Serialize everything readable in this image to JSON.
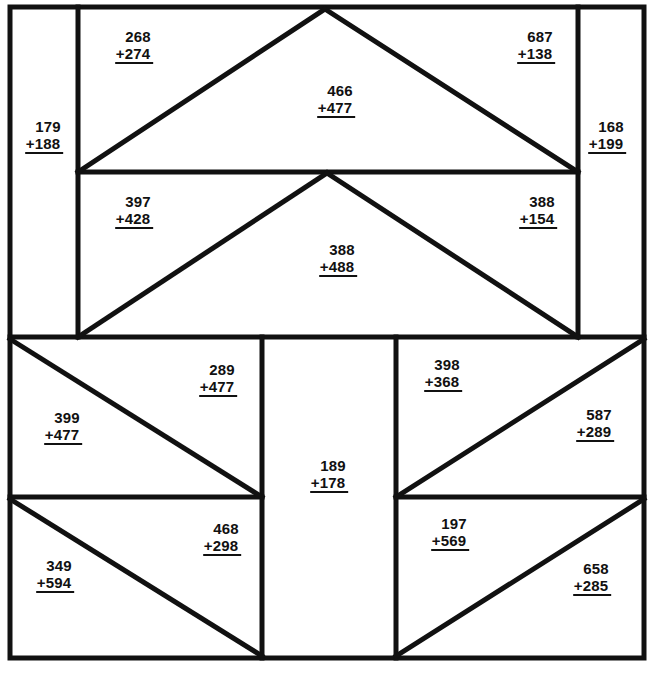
{
  "page": {
    "width": 652,
    "height": 673,
    "background_color": "#ffffff",
    "line_color": "#111111",
    "text_color": "#111111"
  },
  "figure": {
    "outer_border": {
      "x": 10,
      "y": 7,
      "width": 634,
      "height": 651
    },
    "regions": [
      {
        "name": "top-left-side-panel",
        "shape": "rectangle"
      },
      {
        "name": "top-band-upper-left-triangle",
        "shape": "triangle"
      },
      {
        "name": "top-band-upper-center-triangle",
        "shape": "triangle"
      },
      {
        "name": "top-band-upper-right-triangle",
        "shape": "triangle"
      },
      {
        "name": "top-right-side-panel",
        "shape": "rectangle"
      },
      {
        "name": "top-band-lower-left-triangle",
        "shape": "triangle"
      },
      {
        "name": "top-band-lower-center-triangle",
        "shape": "triangle"
      },
      {
        "name": "top-band-lower-right-triangle",
        "shape": "triangle"
      },
      {
        "name": "bottom-center-panel",
        "shape": "rectangle"
      },
      {
        "name": "bottom-upper-left-triangle-a",
        "shape": "triangle"
      },
      {
        "name": "bottom-upper-left-triangle-b",
        "shape": "triangle"
      },
      {
        "name": "bottom-upper-right-triangle-a",
        "shape": "triangle"
      },
      {
        "name": "bottom-upper-right-triangle-b",
        "shape": "triangle"
      },
      {
        "name": "bottom-lower-left-triangle-a",
        "shape": "triangle"
      },
      {
        "name": "bottom-lower-left-triangle-b",
        "shape": "triangle"
      },
      {
        "name": "bottom-lower-right-triangle-a",
        "shape": "triangle"
      },
      {
        "name": "bottom-lower-right-triangle-b",
        "shape": "triangle"
      }
    ]
  },
  "problems": [
    {
      "id": "p01",
      "region": "top-left-side-panel",
      "top": "179",
      "bottom": "+188",
      "x": 44,
      "y": 136
    },
    {
      "id": "p02",
      "region": "top-band-upper-left-triangle",
      "top": "268",
      "bottom": "+274",
      "x": 134,
      "y": 46
    },
    {
      "id": "p03",
      "region": "top-band-upper-center-triangle",
      "top": "466",
      "bottom": "+477",
      "x": 336,
      "y": 100
    },
    {
      "id": "p04",
      "region": "top-band-upper-right-triangle",
      "top": "687",
      "bottom": "+138",
      "x": 536,
      "y": 46
    },
    {
      "id": "p05",
      "region": "top-right-side-panel",
      "x": 607,
      "y": 136,
      "top": "168",
      "bottom": "+199"
    },
    {
      "id": "p06",
      "region": "top-band-lower-left-triangle",
      "top": "397",
      "bottom": "+428",
      "x": 134,
      "y": 211
    },
    {
      "id": "p07",
      "region": "top-band-lower-center-triangle",
      "top": "388",
      "bottom": "+488",
      "x": 338,
      "y": 259
    },
    {
      "id": "p08",
      "region": "top-band-lower-right-triangle",
      "top": "388",
      "bottom": "+154",
      "x": 538,
      "y": 211
    },
    {
      "id": "p09",
      "region": "bottom-upper-left-triangle-b",
      "top": "289",
      "bottom": "+477",
      "x": 218,
      "y": 379
    },
    {
      "id": "p10",
      "region": "bottom-upper-left-triangle-a",
      "top": "399",
      "bottom": "+477",
      "x": 63,
      "y": 427
    },
    {
      "id": "p11",
      "region": "bottom-upper-right-triangle-a",
      "top": "398",
      "bottom": "+368",
      "x": 443,
      "y": 374
    },
    {
      "id": "p12",
      "region": "bottom-upper-right-triangle-b",
      "top": "587",
      "bottom": "+289",
      "x": 595,
      "y": 424
    },
    {
      "id": "p13",
      "region": "bottom-center-panel",
      "top": "189",
      "bottom": "+178",
      "x": 329,
      "y": 475
    },
    {
      "id": "p14",
      "region": "bottom-lower-left-triangle-b",
      "top": "468",
      "bottom": "+298",
      "x": 222,
      "y": 538
    },
    {
      "id": "p15",
      "region": "bottom-lower-left-triangle-a",
      "top": "349",
      "bottom": "+594",
      "x": 55,
      "y": 575
    },
    {
      "id": "p16",
      "region": "bottom-lower-right-triangle-a",
      "top": "197",
      "bottom": "+569",
      "x": 450,
      "y": 533
    },
    {
      "id": "p17",
      "region": "bottom-lower-right-triangle-b",
      "top": "658",
      "bottom": "+285",
      "x": 592,
      "y": 578
    }
  ]
}
